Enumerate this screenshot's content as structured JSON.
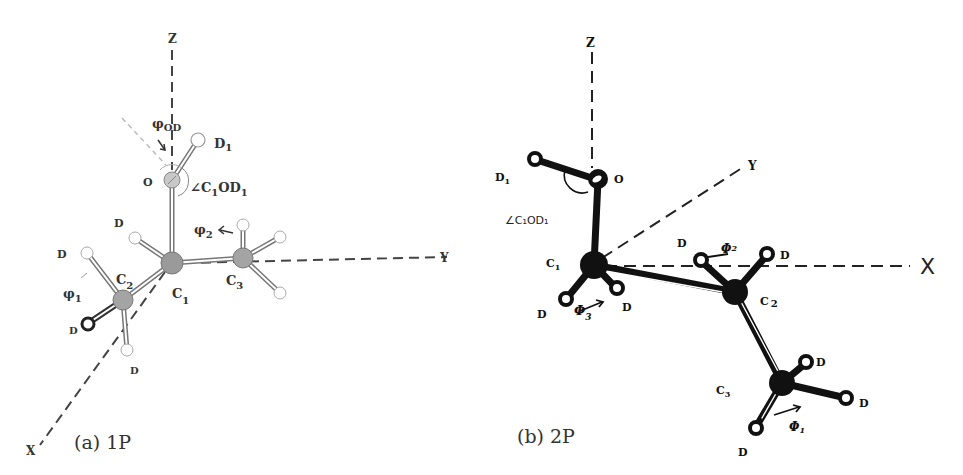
{
  "figure": {
    "panels": [
      {
        "id": "a",
        "caption": "(a) 1P",
        "axes": {
          "z": "Z",
          "y": "Y",
          "x": "X"
        },
        "atoms": {
          "O": "O",
          "C1": "C",
          "C2": "C",
          "C3": "C",
          "D1": "D"
        },
        "labels": {
          "phi_od": "φ",
          "phi_od_sub": "OD",
          "d1": "D",
          "d1_sub": "1",
          "o": "O",
          "angle": "∠C",
          "angle_sub1": "1",
          "angle_mid": "OD",
          "angle_sub2": "1",
          "d_c1": "D",
          "phi2": "φ",
          "phi2_sub": "2",
          "d_left": "D",
          "c2": "C",
          "c2_sub": "2",
          "c1": "C",
          "c1_sub": "1",
          "c3": "C",
          "c3_sub": "3",
          "phi1": "φ",
          "phi1_sub": "1",
          "d_lower_left": "D",
          "d_bottom": "D"
        }
      },
      {
        "id": "b",
        "caption": "(b) 2P",
        "axes": {
          "z": "Z",
          "y": "Y",
          "x": "X"
        },
        "labels": {
          "d1": "D",
          "d1_sub": "1",
          "o": "O",
          "angle": "∠C₁OD₁",
          "c1": "C",
          "c1_sub": "1",
          "d_c1_left": "D",
          "phi3": "Φ",
          "phi3_sub": "3",
          "d_c1_right": "D",
          "d_c2_left": "D",
          "phi2": "Φ",
          "phi2_sub": "2",
          "d_c2_right": "D",
          "c2": "C",
          "c2_sub": "2",
          "c3": "C",
          "c3_sub": "3",
          "d_c3_top": "D",
          "d_c3_right": "D",
          "phi1": "Φ",
          "phi1_sub": "1",
          "d_c3_bottom": "D"
        }
      }
    ],
    "colors": {
      "panel_a_atom": "#9a9a9a",
      "panel_a_bond": "#777777",
      "panel_b_atom": "#111111",
      "background": "#ffffff"
    }
  }
}
